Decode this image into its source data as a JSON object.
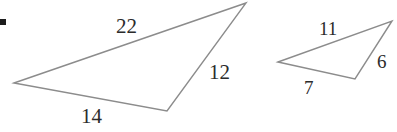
{
  "figure": {
    "background_color": "#ffffff",
    "stroke_color": "#8c8c8c",
    "label_color": "#2b2b2b",
    "stroke_width": 1.4,
    "width": 397,
    "height": 132
  },
  "shapes": {
    "large_triangle": {
      "name": "large-triangle",
      "points": "14,83 246,3 167,111",
      "vertices": [
        {
          "name": "left-vertex",
          "x": 14,
          "y": 83
        },
        {
          "name": "apex-vertex",
          "x": 246,
          "y": 3
        },
        {
          "name": "bottom-vertex",
          "x": 167,
          "y": 111
        }
      ],
      "labels": [
        {
          "id": "large-22",
          "text": "22",
          "side": "left-vertex-to-apex"
        },
        {
          "id": "large-12",
          "text": "12",
          "side": "apex-to-bottom-vertex"
        },
        {
          "id": "large-14",
          "text": "14",
          "side": "left-vertex-to-bottom-vertex"
        }
      ]
    },
    "small_triangle": {
      "name": "small-triangle",
      "points": "278,62 392,21 355,79",
      "vertices": [
        {
          "name": "left-vertex",
          "x": 278,
          "y": 62
        },
        {
          "name": "apex-vertex",
          "x": 392,
          "y": 21
        },
        {
          "name": "bottom-vertex",
          "x": 355,
          "y": 79
        }
      ],
      "labels": [
        {
          "id": "small-11",
          "text": "11",
          "side": "left-vertex-to-apex"
        },
        {
          "id": "small-6",
          "text": "6",
          "side": "apex-to-bottom-vertex"
        },
        {
          "id": "small-7",
          "text": "7",
          "side": "left-vertex-to-bottom-vertex"
        }
      ]
    }
  },
  "labels": {
    "large_top": "22",
    "large_right": "12",
    "large_bottom": "14",
    "small_top": "11",
    "small_right": "6",
    "small_bottom": "7"
  },
  "marks": {
    "corner_mark": {
      "name": "corner-mark",
      "color": "#1d1d1d"
    }
  }
}
